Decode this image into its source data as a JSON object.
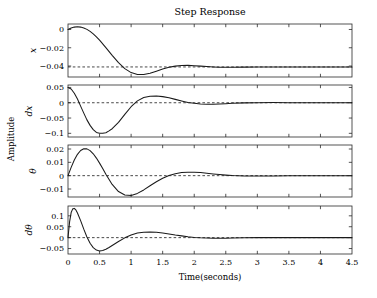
{
  "figure": {
    "title": "Step Response",
    "xlabel": "Time(seconds)",
    "ylabel": "Amplitude"
  },
  "chart_data": {
    "type": "line",
    "title": "Step Response",
    "xlabel": "Time(seconds)",
    "ylabel": "Amplitude",
    "xlim": [
      0,
      4.5
    ],
    "xticks": [
      0,
      0.5,
      1,
      1.5,
      2,
      2.5,
      3,
      3.5,
      4,
      4.5
    ],
    "xticklabels": [
      "0",
      "0.5",
      "1",
      "1.5",
      "2",
      "2.5",
      "3",
      "3.5",
      "4",
      "4.5"
    ],
    "grid": false,
    "legend": "none",
    "subplots": [
      {
        "name": "x",
        "ylabel": "x",
        "ylim": [
          -0.052,
          0.006
        ],
        "yticks": [
          0,
          -0.02,
          -0.04
        ],
        "yticklabels": [
          "0",
          "−0.02",
          "−0.04"
        ],
        "reference_line": -0.041,
        "x": [
          0,
          0.05,
          0.1,
          0.15,
          0.2,
          0.25,
          0.3,
          0.35,
          0.4,
          0.45,
          0.5,
          0.6,
          0.7,
          0.8,
          0.9,
          1.0,
          1.1,
          1.2,
          1.3,
          1.4,
          1.5,
          1.6,
          1.7,
          1.8,
          1.9,
          2.0,
          2.1,
          2.2,
          2.3,
          2.4,
          2.5,
          2.6,
          2.8,
          3.0,
          3.25,
          3.5,
          3.75,
          4.0,
          4.25,
          4.5
        ],
        "y": [
          0,
          0.0016,
          0.0026,
          0.0029,
          0.0026,
          0.0016,
          0.0001,
          -0.0021,
          -0.0048,
          -0.008,
          -0.0116,
          -0.0198,
          -0.0283,
          -0.0363,
          -0.0428,
          -0.0472,
          -0.0492,
          -0.0492,
          -0.0478,
          -0.0456,
          -0.0433,
          -0.0414,
          -0.0401,
          -0.0394,
          -0.0393,
          -0.0396,
          -0.0401,
          -0.0406,
          -0.041,
          -0.0413,
          -0.0414,
          -0.0414,
          -0.0412,
          -0.041,
          -0.041,
          -0.041,
          -0.041,
          -0.041,
          -0.041,
          -0.041
        ]
      },
      {
        "name": "dx",
        "ylabel": "dx",
        "ylim": [
          -0.112,
          0.058
        ],
        "yticks": [
          0.05,
          0,
          -0.05,
          -0.1
        ],
        "yticklabels": [
          "0.05",
          "0",
          "−0.05",
          "−0.1"
        ],
        "reference_line": 0,
        "x": [
          0,
          0.05,
          0.1,
          0.15,
          0.2,
          0.25,
          0.3,
          0.35,
          0.4,
          0.45,
          0.5,
          0.55,
          0.6,
          0.65,
          0.7,
          0.8,
          0.9,
          1.0,
          1.1,
          1.2,
          1.3,
          1.4,
          1.5,
          1.6,
          1.7,
          1.8,
          1.9,
          2.0,
          2.1,
          2.2,
          2.3,
          2.4,
          2.5,
          2.6,
          2.8,
          3.0,
          3.25,
          3.5,
          3.75,
          4.0,
          4.25,
          4.5
        ],
        "y": [
          0.05,
          0.045,
          0.031,
          0.012,
          -0.011,
          -0.034,
          -0.056,
          -0.074,
          -0.088,
          -0.097,
          -0.1,
          -0.1,
          -0.098,
          -0.092,
          -0.085,
          -0.064,
          -0.038,
          -0.013,
          0.006,
          0.017,
          0.021,
          0.022,
          0.02,
          0.016,
          0.011,
          0.006,
          0.001,
          -0.002,
          -0.004,
          -0.005,
          -0.005,
          -0.004,
          -0.003,
          -0.002,
          -0.0005,
          0.0003,
          0.0005,
          0.0003,
          0.0001,
          0,
          0,
          0
        ]
      },
      {
        "name": "theta",
        "ylabel": "θ",
        "ylim": [
          -0.016,
          0.023
        ],
        "yticks": [
          0.02,
          0.01,
          0,
          -0.01
        ],
        "yticklabels": [
          "0.02",
          "0.01",
          "0",
          "−0.01"
        ],
        "reference_line": 0,
        "x": [
          0,
          0.05,
          0.1,
          0.15,
          0.2,
          0.25,
          0.3,
          0.35,
          0.4,
          0.45,
          0.5,
          0.55,
          0.6,
          0.7,
          0.8,
          0.9,
          1.0,
          1.1,
          1.2,
          1.3,
          1.4,
          1.5,
          1.6,
          1.7,
          1.8,
          1.9,
          2.0,
          2.1,
          2.2,
          2.3,
          2.4,
          2.5,
          2.6,
          2.8,
          3.0,
          3.25,
          3.5,
          3.75,
          4.0,
          4.25,
          4.5
        ],
        "y": [
          0,
          0.0062,
          0.0117,
          0.016,
          0.0189,
          0.0202,
          0.0201,
          0.0188,
          0.0164,
          0.0132,
          0.0094,
          0.0053,
          0.0011,
          -0.0066,
          -0.0119,
          -0.0145,
          -0.0148,
          -0.0133,
          -0.0107,
          -0.0076,
          -0.0046,
          -0.002,
          0.0001,
          0.0015,
          0.0023,
          0.0026,
          0.0026,
          0.0023,
          0.0018,
          0.0013,
          0.0008,
          0.0004,
          0.0001,
          -0.0002,
          -0.0003,
          -0.0002,
          -0.0001,
          0,
          0,
          0,
          0
        ]
      },
      {
        "name": "dtheta",
        "ylabel": "dθ",
        "ylim": [
          -0.075,
          0.145
        ],
        "yticks": [
          0.1,
          0.05,
          0,
          -0.05
        ],
        "yticklabels": [
          "0.1",
          "0.05",
          "0",
          "−0.05"
        ],
        "reference_line": 0,
        "x": [
          0,
          0.025,
          0.05,
          0.075,
          0.1,
          0.125,
          0.15,
          0.2,
          0.25,
          0.3,
          0.35,
          0.4,
          0.45,
          0.5,
          0.55,
          0.6,
          0.65,
          0.7,
          0.8,
          0.9,
          1.0,
          1.1,
          1.2,
          1.3,
          1.4,
          1.5,
          1.6,
          1.7,
          1.8,
          1.9,
          2.0,
          2.1,
          2.2,
          2.3,
          2.4,
          2.5,
          2.6,
          2.8,
          3.0,
          3.25,
          3.5,
          3.75,
          4.0,
          4.25,
          4.5
        ],
        "y": [
          0,
          0.072,
          0.115,
          0.132,
          0.134,
          0.127,
          0.113,
          0.078,
          0.039,
          0.003,
          -0.026,
          -0.046,
          -0.057,
          -0.061,
          -0.059,
          -0.053,
          -0.045,
          -0.036,
          -0.018,
          -0.001,
          0.012,
          0.021,
          0.025,
          0.026,
          0.025,
          0.021,
          0.017,
          0.012,
          0.008,
          0.004,
          0.001,
          -0.001,
          -0.002,
          -0.003,
          -0.003,
          -0.003,
          -0.002,
          -0.001,
          0,
          0,
          0,
          0,
          0,
          0,
          0
        ]
      }
    ]
  }
}
